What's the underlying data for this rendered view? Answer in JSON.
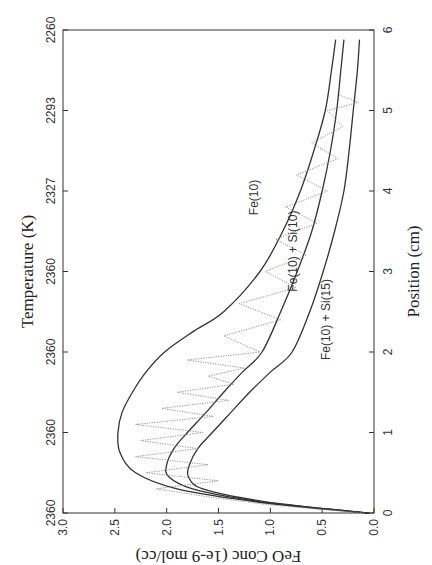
{
  "chart_data": {
    "type": "line",
    "orientation_note_rotated_ccw": true,
    "title": "",
    "xlabel": "Position (cm)",
    "ylabel": "FeO Conc (1e-9 mol/cc)",
    "top_axis_label": "Temperature (K)",
    "xlim": [
      0,
      6
    ],
    "ylim": [
      0,
      3.0
    ],
    "x_ticks": [
      "0",
      "1",
      "2",
      "3",
      "4",
      "5",
      "6"
    ],
    "y_ticks": [
      "0.0",
      "0.5",
      "1.0",
      "1.5",
      "2.0",
      "2.5",
      "3.0"
    ],
    "top_ticks": [
      "2360",
      "2360",
      "2360",
      "2360",
      "2327",
      "2293",
      "2260"
    ],
    "grid": false,
    "legend": "inline labels",
    "series": [
      {
        "name": "Fe(10)",
        "style": "solid",
        "x": [
          0.0,
          0.05,
          0.15,
          0.3,
          0.5,
          0.75,
          1.0,
          1.25,
          1.5,
          1.75,
          2.0,
          2.25,
          2.5,
          3.0,
          3.5,
          4.0,
          4.5,
          5.0,
          5.5,
          5.88
        ],
        "y": [
          0.05,
          0.5,
          1.2,
          1.9,
          2.3,
          2.45,
          2.47,
          2.43,
          2.33,
          2.2,
          2.02,
          1.75,
          1.45,
          1.1,
          0.88,
          0.71,
          0.58,
          0.47,
          0.41,
          0.37
        ]
      },
      {
        "name": "Fe(10) + Si(10)",
        "style": "solid",
        "x": [
          0.0,
          0.05,
          0.15,
          0.3,
          0.45,
          0.6,
          0.8,
          1.0,
          1.25,
          1.5,
          1.75,
          2.0,
          2.5,
          3.0,
          3.5,
          4.0,
          4.5,
          5.0,
          5.5,
          5.88
        ],
        "y": [
          0.05,
          0.45,
          1.15,
          1.75,
          1.98,
          2.0,
          1.93,
          1.8,
          1.62,
          1.45,
          1.27,
          1.08,
          0.9,
          0.74,
          0.6,
          0.5,
          0.42,
          0.36,
          0.32,
          0.29
        ]
      },
      {
        "name": "Fe(10) + Si(15)",
        "style": "solid",
        "x": [
          0.0,
          0.05,
          0.15,
          0.3,
          0.45,
          0.6,
          0.8,
          1.0,
          1.25,
          1.5,
          1.75,
          2.0,
          2.5,
          3.0,
          3.5,
          4.0,
          4.5,
          5.0,
          5.5,
          5.88
        ],
        "y": [
          0.05,
          0.45,
          1.1,
          1.65,
          1.79,
          1.78,
          1.7,
          1.56,
          1.38,
          1.2,
          1.0,
          0.79,
          0.62,
          0.49,
          0.38,
          0.29,
          0.24,
          0.2,
          0.16,
          0.14
        ]
      },
      {
        "name": "Experimental (dotted)",
        "style": "dotted",
        "x_range": [
          0.0,
          5.2
        ],
        "description": "Noisy zigzag measurement oscillating roughly between the Fe(10)+Si(10) and Fe(10) curves, amplitude ~±0.3",
        "x": [
          0.0,
          0.1,
          0.2,
          0.3,
          0.4,
          0.5,
          0.6,
          0.7,
          0.8,
          0.9,
          1.0,
          1.1,
          1.2,
          1.3,
          1.4,
          1.5,
          1.6,
          1.7,
          1.8,
          1.9,
          2.0,
          2.2,
          2.4,
          2.6,
          2.8,
          3.0,
          3.2,
          3.4,
          3.6,
          3.8,
          4.0,
          4.2,
          4.4,
          4.6,
          4.8,
          5.0,
          5.1,
          5.2
        ],
        "y": [
          0.1,
          1.0,
          1.6,
          2.1,
          1.5,
          2.2,
          1.6,
          2.3,
          1.7,
          2.25,
          1.65,
          2.3,
          1.55,
          2.05,
          1.4,
          1.9,
          1.35,
          1.6,
          1.25,
          1.8,
          1.1,
          1.45,
          0.9,
          1.3,
          0.75,
          1.05,
          0.65,
          0.95,
          0.55,
          0.85,
          0.45,
          0.75,
          0.35,
          0.6,
          0.3,
          0.45,
          0.15,
          0.35
        ]
      }
    ]
  },
  "labels": {
    "fe10": "Fe(10)",
    "fe10_si10": "Fe(10) + Si(10)",
    "fe10_si15": "Fe(10) + Si(15)"
  }
}
